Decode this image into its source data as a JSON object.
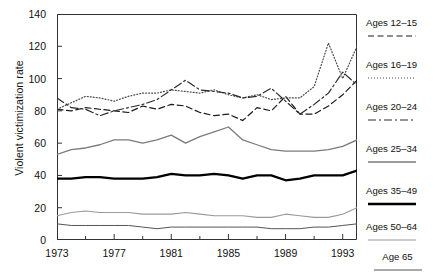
{
  "chart_data": {
    "type": "line",
    "title": "",
    "xlabel": "",
    "ylabel": "Violent victimization rate",
    "xlim": [
      1973,
      1994
    ],
    "ylim": [
      0,
      140
    ],
    "grid": false,
    "legend_position": "right",
    "x": [
      1973,
      1974,
      1975,
      1976,
      1977,
      1978,
      1979,
      1980,
      1981,
      1982,
      1983,
      1984,
      1985,
      1986,
      1987,
      1988,
      1989,
      1990,
      1991,
      1992,
      1993,
      1994
    ],
    "y_ticks": [
      0,
      20,
      40,
      60,
      80,
      100,
      120,
      140
    ],
    "x_ticks_major": [
      1973,
      1977,
      1981,
      1985,
      1989,
      1993
    ],
    "x_ticks_minor": [
      1975,
      1979,
      1983,
      1987,
      1991
    ],
    "series": [
      {
        "name": "Ages 12–15",
        "style": "dashed",
        "color": "#1a1a1a",
        "width": 1.2,
        "dash": "6,3.5",
        "values": [
          81,
          80,
          82,
          81,
          80,
          79,
          83,
          81,
          84,
          83,
          79,
          77,
          78,
          74,
          82,
          80,
          89,
          78,
          78,
          83,
          90,
          99
        ]
      },
      {
        "name": "Ages 16–19",
        "style": "dotted",
        "color": "#4a4a4a",
        "width": 1.2,
        "dash": "1,2",
        "values": [
          81,
          85,
          89,
          88,
          86,
          89,
          91,
          91,
          93,
          92,
          91,
          93,
          90,
          88,
          90,
          87,
          88,
          88,
          95,
          122,
          100,
          120
        ]
      },
      {
        "name": "Ages 20–24",
        "style": "dash-dot",
        "color": "#2a2a2a",
        "width": 1.2,
        "dash": "8,3,2,3",
        "values": [
          88,
          82,
          81,
          77,
          80,
          82,
          84,
          87,
          93,
          99,
          93,
          92,
          91,
          88,
          89,
          94,
          86,
          78,
          84,
          91,
          104,
          96
        ]
      },
      {
        "name": "Ages 25–34",
        "style": "solid-thin-gray",
        "color": "#7b7b7b",
        "width": 1.3,
        "dash": "",
        "values": [
          53,
          56,
          57,
          59,
          62,
          62,
          60,
          62,
          65,
          60,
          64,
          67,
          70,
          62,
          59,
          56,
          55,
          55,
          55,
          56,
          58,
          62
        ]
      },
      {
        "name": "Ages 35–49",
        "style": "solid-thick-black",
        "color": "#000000",
        "width": 2.3,
        "dash": "",
        "values": [
          38,
          38,
          39,
          39,
          38,
          38,
          38,
          39,
          41,
          40,
          40,
          41,
          40,
          38,
          40,
          40,
          37,
          38,
          40,
          40,
          40,
          43
        ]
      },
      {
        "name": "Ages 50–64",
        "style": "solid-light-gray",
        "color": "#9a9a9a",
        "width": 1.1,
        "dash": "",
        "values": [
          15,
          17,
          18,
          17,
          17,
          17,
          16,
          16,
          16,
          17,
          16,
          15,
          15,
          15,
          14,
          14,
          16,
          15,
          14,
          14,
          16,
          20
        ]
      },
      {
        "name": "Age 65",
        "style": "solid-thin-dark",
        "color": "#555555",
        "width": 1.0,
        "dash": "",
        "values": [
          10,
          9,
          9,
          9,
          9,
          9,
          8,
          7,
          8,
          8,
          8,
          8,
          8,
          8,
          8,
          7,
          7,
          7,
          8,
          8,
          9,
          10
        ]
      }
    ]
  },
  "axis": {
    "y_tick_labels": [
      "0",
      "20",
      "40",
      "60",
      "80",
      "100",
      "120",
      "140"
    ],
    "x_tick_labels": [
      "1973",
      "1977",
      "1981",
      "1985",
      "1989",
      "1993"
    ]
  },
  "legend": {
    "items": [
      {
        "label": "Ages 12–15"
      },
      {
        "label": "Ages 16–19"
      },
      {
        "label": "Ages 20–24"
      },
      {
        "label": "Ages 25–34"
      },
      {
        "label": "Ages 35–49"
      },
      {
        "label": "Ages 50–64"
      },
      {
        "label": "Age 65"
      }
    ]
  }
}
